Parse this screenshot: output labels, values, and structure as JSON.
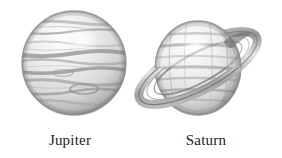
{
  "figure": {
    "style": "grayscale pencil / engraved illustration",
    "background_color": "#ffffff",
    "width": 282,
    "height": 158
  },
  "palette": {
    "background": "#ffffff",
    "ink": "#1c1c1c",
    "outline": "#8d8d8d",
    "shade_dark": "#6f6f6f",
    "shade_mid": "#a9a9a9",
    "shade_light": "#d2d2d2",
    "highlight": "#fdfdfd"
  },
  "planets": [
    {
      "id": "jupiter",
      "label": "Jupiter",
      "has_rings": false,
      "band_count": 9,
      "center": {
        "x": 74,
        "y": 63
      },
      "radius": 52,
      "highlight": {
        "x": 82,
        "y": 40
      }
    },
    {
      "id": "saturn",
      "label": "Saturn",
      "has_rings": true,
      "band_count": 7,
      "center": {
        "x": 198,
        "y": 68
      },
      "radius_x": 43,
      "radius_y": 47,
      "ring": {
        "tilt_degrees": -28,
        "outer_radius_x": 66,
        "outer_radius_y": 22,
        "inner_radius_x": 49,
        "inner_radius_y": 15,
        "tip_upper_right": {
          "x": 265,
          "y": 14
        },
        "tip_lower_left": {
          "x": 148,
          "y": 124
        }
      },
      "highlight": {
        "x": 196,
        "y": 46
      }
    }
  ],
  "icons": {
    "jupiter": "planet-sphere-icon",
    "saturn": "ringed-planet-icon"
  }
}
